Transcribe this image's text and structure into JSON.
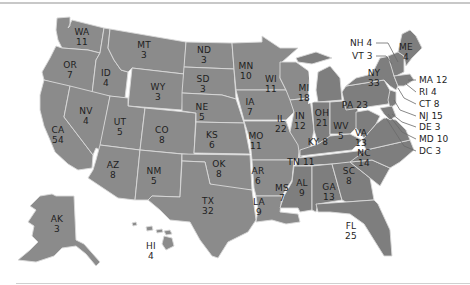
{
  "map": {
    "title": "",
    "type": "US electoral votes by state",
    "fill_color": "#8b8b8b",
    "border_color": "#d9d9d9",
    "text_color": "#1e1e1e",
    "states": [
      {
        "abbr": "WA",
        "ev": "11"
      },
      {
        "abbr": "OR",
        "ev": "7"
      },
      {
        "abbr": "CA",
        "ev": "54"
      },
      {
        "abbr": "ID",
        "ev": "4"
      },
      {
        "abbr": "NV",
        "ev": "4"
      },
      {
        "abbr": "MT",
        "ev": "3"
      },
      {
        "abbr": "WY",
        "ev": "3"
      },
      {
        "abbr": "UT",
        "ev": "5"
      },
      {
        "abbr": "CO",
        "ev": "8"
      },
      {
        "abbr": "AZ",
        "ev": "8"
      },
      {
        "abbr": "NM",
        "ev": "5"
      },
      {
        "abbr": "ND",
        "ev": "3"
      },
      {
        "abbr": "SD",
        "ev": "3"
      },
      {
        "abbr": "NE",
        "ev": "5"
      },
      {
        "abbr": "KS",
        "ev": "6"
      },
      {
        "abbr": "OK",
        "ev": "8"
      },
      {
        "abbr": "TX",
        "ev": "32"
      },
      {
        "abbr": "MN",
        "ev": "10"
      },
      {
        "abbr": "IA",
        "ev": "7"
      },
      {
        "abbr": "MO",
        "ev": "11"
      },
      {
        "abbr": "AR",
        "ev": "6"
      },
      {
        "abbr": "LA",
        "ev": "9"
      },
      {
        "abbr": "WI",
        "ev": "11"
      },
      {
        "abbr": "IL",
        "ev": "22"
      },
      {
        "abbr": "MI",
        "ev": "18"
      },
      {
        "abbr": "IN",
        "ev": "12"
      },
      {
        "abbr": "OH",
        "ev": "21"
      },
      {
        "abbr": "KY",
        "ev": "8"
      },
      {
        "abbr": "TN",
        "ev": "11"
      },
      {
        "abbr": "MS",
        "ev": "7"
      },
      {
        "abbr": "AL",
        "ev": "9"
      },
      {
        "abbr": "GA",
        "ev": "13"
      },
      {
        "abbr": "FL",
        "ev": "25"
      },
      {
        "abbr": "SC",
        "ev": "8"
      },
      {
        "abbr": "NC",
        "ev": "14"
      },
      {
        "abbr": "VA",
        "ev": "13"
      },
      {
        "abbr": "WV",
        "ev": "5"
      },
      {
        "abbr": "PA",
        "ev": "23"
      },
      {
        "abbr": "NY",
        "ev": "33"
      },
      {
        "abbr": "ME",
        "ev": "4"
      },
      {
        "abbr": "AK",
        "ev": "3"
      },
      {
        "abbr": "HI",
        "ev": "4"
      }
    ],
    "callouts": [
      {
        "abbr": "NH",
        "ev": "4"
      },
      {
        "abbr": "VT",
        "ev": "3"
      },
      {
        "abbr": "MA",
        "ev": "12"
      },
      {
        "abbr": "RI",
        "ev": "4"
      },
      {
        "abbr": "CT",
        "ev": "8"
      },
      {
        "abbr": "NJ",
        "ev": "15"
      },
      {
        "abbr": "DE",
        "ev": "3"
      },
      {
        "abbr": "MD",
        "ev": "10"
      },
      {
        "abbr": "DC",
        "ev": "3"
      }
    ]
  }
}
